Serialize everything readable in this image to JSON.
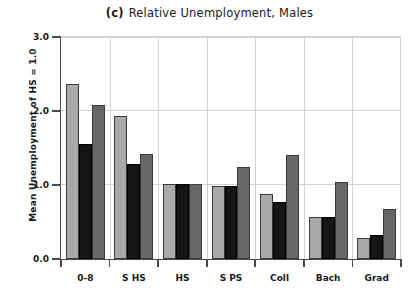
{
  "chart_data": {
    "type": "bar",
    "title": "Relative Unemployment, Males",
    "panel_label": "(c)",
    "xlabel": "",
    "ylabel": "Mean Unemployment of HS = 1.0",
    "categories": [
      "0-8",
      "S HS",
      "HS",
      "S PS",
      "Coll",
      "Bach",
      "Grad"
    ],
    "series": [
      {
        "name": "series-1",
        "color": "#a9a9a9",
        "values": [
          2.36,
          1.93,
          1.01,
          0.99,
          0.88,
          0.57,
          0.29
        ]
      },
      {
        "name": "series-2",
        "color": "#161616",
        "values": [
          1.55,
          1.29,
          1.01,
          0.99,
          0.77,
          0.57,
          0.32
        ]
      },
      {
        "name": "series-3",
        "color": "#676767",
        "values": [
          2.08,
          1.42,
          1.01,
          1.25,
          1.41,
          1.04,
          0.68
        ]
      }
    ],
    "ylim": [
      0.0,
      3.0
    ],
    "yticks": [
      "0.0",
      "1.0",
      "2.0",
      "3.0"
    ],
    "ytick_values": [
      0.0,
      1.0,
      2.0,
      3.0
    ],
    "grid": "horizontal-and-vertical",
    "legend": "none"
  }
}
